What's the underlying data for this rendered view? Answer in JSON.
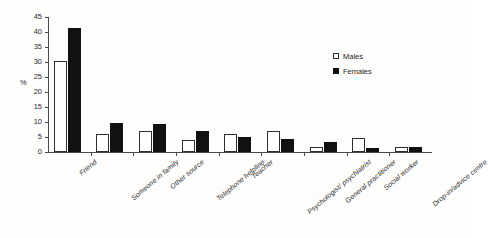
{
  "chart_data": {
    "type": "bar",
    "title": "",
    "xlabel": "",
    "ylabel": "%",
    "ylim": [
      0,
      45
    ],
    "yticks": [
      0,
      5,
      10,
      15,
      20,
      25,
      30,
      35,
      40,
      45
    ],
    "grid": false,
    "legend_position": "top-right",
    "categories": [
      "Friend",
      "Someone in family",
      "Other source",
      "Telephone helpline",
      "Teacher",
      "Psychologist/ psychiatrist",
      "General practitioner",
      "Social worker",
      "Drop-in/advice centre"
    ],
    "series": [
      {
        "name": "Males",
        "color": "#ffffff",
        "values": [
          30.5,
          6.0,
          7.0,
          4.0,
          6.0,
          6.9,
          1.8,
          4.8,
          1.7
        ]
      },
      {
        "name": "Females",
        "color": "#111111",
        "values": [
          41.5,
          9.7,
          9.3,
          6.9,
          4.9,
          4.5,
          3.4,
          1.4,
          1.6
        ]
      }
    ]
  },
  "legend": {
    "items": [
      {
        "label": "Males",
        "swatch": "open-square-icon"
      },
      {
        "label": "Females",
        "swatch": "filled-square-icon"
      }
    ]
  },
  "axis": {
    "y_label": "%",
    "tick_labels": [
      "0",
      "5",
      "10",
      "15",
      "20",
      "25",
      "30",
      "35",
      "40",
      "45"
    ]
  }
}
